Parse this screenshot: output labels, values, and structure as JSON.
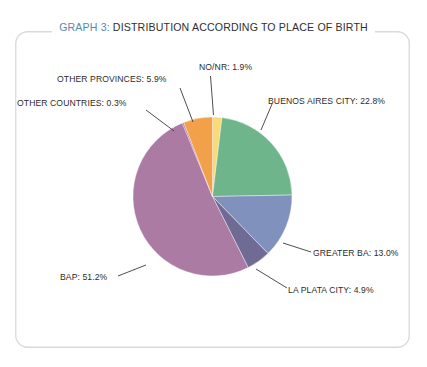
{
  "figure": {
    "title_prefix": "GRAPH 3:",
    "title_text": " DISTRIBUTION ACCORDING TO PLACE OF BIRTH",
    "title_accent_color": "#5b86ab",
    "title_text_color": "#2f2f2f",
    "background_color": "#ffffff",
    "border_color": "#d8d8d8"
  },
  "labels": {
    "nonr": "NO/NR: 1.9%",
    "buenos_aires_city": "BUENOS AIRES CITY: 22.8%",
    "other_provinces": "OTHER PROVINCES: 5.9%",
    "other_countries": "OTHER COUNTRIES: 0.3%",
    "greater_ba": "GREATER BA: 13.0%",
    "la_plata_city": "LA PLATA CITY: 4.9%",
    "bap": "BAP: 51.2%"
  },
  "chart_data": {
    "type": "pie",
    "title": "GRAPH 3: DISTRIBUTION ACCORDING TO PLACE OF BIRTH",
    "xlabel": "",
    "ylabel": "",
    "legend": "none",
    "grid": false,
    "units": "percent",
    "start_angle_deg": 0,
    "direction": "clockwise",
    "categories": [
      "NO/NR",
      "BUENOS AIRES CITY",
      "GREATER BA",
      "LA PLATA CITY",
      "BAP",
      "OTHER COUNTRIES",
      "OTHER PROVINCES"
    ],
    "values": [
      1.9,
      22.8,
      13.0,
      4.9,
      51.2,
      0.3,
      5.9
    ],
    "colors": [
      "#f8da78",
      "#6fb58c",
      "#8191bd",
      "#6f6b95",
      "#ab7ba4",
      "#a878a2",
      "#f2a04a"
    ],
    "data_labels": [
      "NO/NR: 1.9%",
      "BUENOS AIRES CITY: 22.8%",
      "GREATER BA: 13.0%",
      "LA PLATA CITY: 4.9%",
      "BAP: 51.2%",
      "OTHER COUNTRIES: 0.3%",
      "OTHER PROVINCES: 5.9%"
    ],
    "total": 100.0
  }
}
